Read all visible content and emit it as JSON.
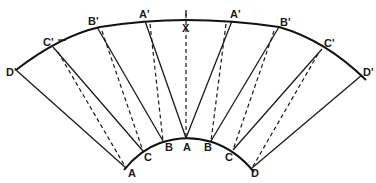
{
  "diagram": {
    "type": "annular-sector-construction",
    "outer_labels": {
      "left": [
        "D'",
        "C'",
        "B'",
        "A'"
      ],
      "center": "X",
      "right": [
        "A'",
        "B'",
        "C'",
        "D'"
      ]
    },
    "inner_labels": {
      "left": [
        "A",
        "C",
        "B"
      ],
      "center": "A",
      "right": [
        "B",
        "C",
        "D"
      ]
    },
    "labels": {
      "o_d_left": "D'",
      "o_c_left": "C'",
      "o_b_left": "B'",
      "o_a_left": "A'",
      "o_x": "X",
      "o_a_right": "A'",
      "o_b_right": "B'",
      "o_c_right": "C'",
      "o_d_right": "D'",
      "i_a_left": "A",
      "i_c_left": "C",
      "i_b_left": "B",
      "i_a_center": "A",
      "i_b_right": "B",
      "i_c_right": "C",
      "i_d_right": "D"
    },
    "line_color": "#1a1a1a",
    "background": "#ffffff"
  }
}
